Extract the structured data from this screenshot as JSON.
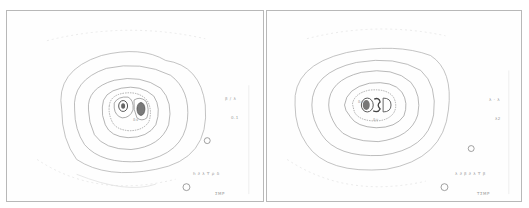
{
  "figure": {
    "panels": [
      {
        "id": "left",
        "labels": {
          "upper_right_1": "β / λ",
          "upper_right_2": "0.1",
          "bottom_row": "h  ∂   λ ϒ   ρ δ",
          "bottom_caption": "ΣΜΡ",
          "center_label": "δν"
        },
        "contour_levels": 8,
        "core_lobes": 2
      },
      {
        "id": "right",
        "labels": {
          "upper_right_1": "λ · λ",
          "upper_right_2": "λ2",
          "bottom_row": "λ  ∂   β ∂ λ ϒ β",
          "bottom_caption": "ΤΣΜΡ",
          "center_label_left": "δν",
          "center_label_bottom": "δν"
        },
        "contour_levels": 8,
        "core_lobes": 2
      }
    ],
    "colors": {
      "line": "#8a8a8a",
      "dark_core": "#555555",
      "frame": "#b8b8b8",
      "text": "#9a9a9a"
    }
  }
}
